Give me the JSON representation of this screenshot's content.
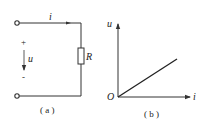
{
  "figure_a": {
    "current_label": "i",
    "voltage_label": "u",
    "plus_sign": "+",
    "minus_sign": "-",
    "resistor_label": "R",
    "caption": "( a )"
  },
  "figure_b": {
    "y_axis_label": "u",
    "x_axis_label": "i",
    "origin_label": "O",
    "caption": "( b )"
  },
  "colors": {
    "line": "#333333",
    "background": "#ffffff"
  }
}
